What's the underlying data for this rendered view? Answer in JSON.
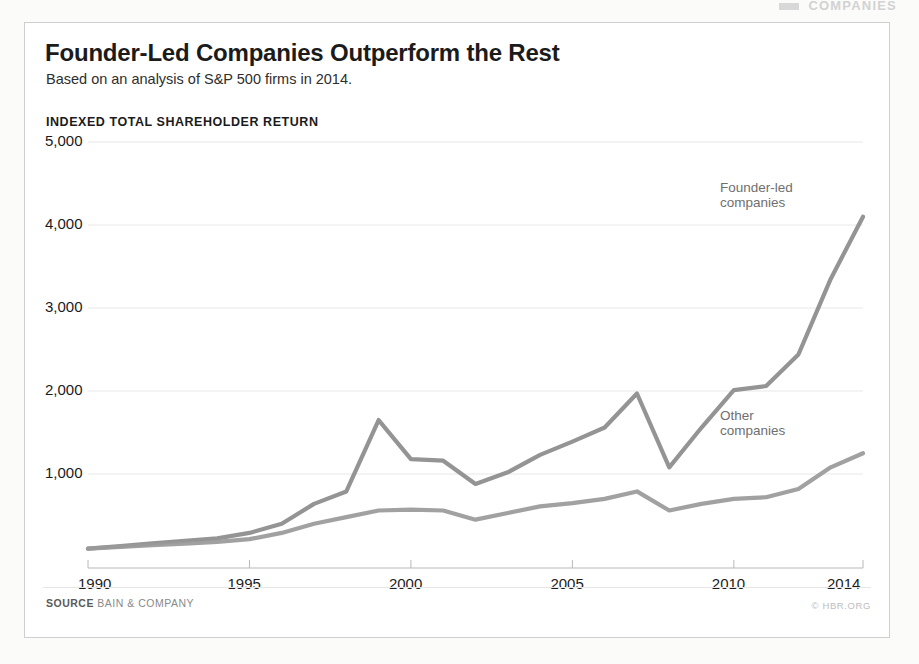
{
  "scan_header": {
    "text": "COMPANIES"
  },
  "header": {
    "title": "Founder-Led Companies Outperform the Rest",
    "subtitle": "Based on an analysis of S&P 500 firms in 2014."
  },
  "footer": {
    "source_label": "SOURCE",
    "source_name": "BAIN & COMPANY",
    "credit": "© HBR.ORG"
  },
  "chart_data": {
    "type": "line",
    "title": "Founder-Led Companies Outperform the Rest",
    "subtitle": "Based on an analysis of S&P 500 firms in 2014.",
    "ylabel": "INDEXED TOTAL SHAREHOLDER RETURN",
    "xlabel": "",
    "ylim": [
      0,
      5000
    ],
    "xlim": [
      1990,
      2014
    ],
    "yticks": [
      1000,
      2000,
      3000,
      4000,
      5000
    ],
    "ytick_labels": [
      "1,000",
      "2,000",
      "3,000",
      "4,000",
      "5,000"
    ],
    "xticks": [
      1990,
      1995,
      2000,
      2005,
      2010,
      2014
    ],
    "xtick_labels": [
      "1990",
      "1995",
      "2000",
      "2005",
      "2010",
      "2014"
    ],
    "grid": true,
    "grid_axis": "y",
    "legend_position": "inline-annotations",
    "x": [
      1990,
      1991,
      1992,
      1993,
      1994,
      1995,
      1996,
      1997,
      1998,
      1999,
      2000,
      2001,
      2002,
      2003,
      2004,
      2005,
      2006,
      2007,
      2008,
      2009,
      2010,
      2011,
      2012,
      2013,
      2014
    ],
    "series": [
      {
        "name": "Founder-led companies",
        "color": "#8c8c8c",
        "values": [
          100,
          130,
          165,
          195,
          225,
          290,
          400,
          640,
          790,
          1650,
          1180,
          1160,
          880,
          1020,
          1230,
          1390,
          1560,
          1970,
          1080,
          1560,
          2010,
          2060,
          2440,
          3350,
          4100
        ]
      },
      {
        "name": "Other companies",
        "color": "#9a9a9a",
        "values": [
          100,
          122,
          142,
          162,
          182,
          215,
          290,
          400,
          480,
          560,
          570,
          560,
          450,
          530,
          610,
          650,
          700,
          790,
          560,
          640,
          700,
          720,
          820,
          1080,
          1250
        ]
      }
    ],
    "annotations": [
      {
        "text": "Founder-led companies",
        "near_x": 2012,
        "near_y": 4600
      },
      {
        "text": "Other companies",
        "near_x": 2011,
        "near_y": 1600
      }
    ]
  },
  "style": {
    "line_color_founder": "#8c8c8c",
    "line_color_other": "#9a9a9a",
    "grid_color": "#e8e8e8",
    "axis_color": "#b8b8b8",
    "card_border": "#cfcfcf",
    "page_bg": "#fbfbfa",
    "text_color": "#1b1b1b"
  }
}
